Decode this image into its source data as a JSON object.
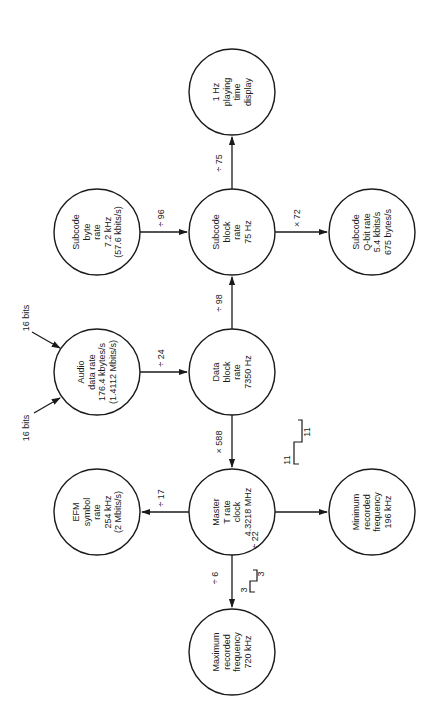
{
  "diagram": {
    "orientation": "rotated-90-ccw",
    "nodes": [
      {
        "id": "playing_time",
        "lines": [
          "1 Hz",
          "playing",
          "time",
          "display"
        ],
        "cx": 232,
        "cy": 92
      },
      {
        "id": "subcode_byte",
        "lines": [
          "Subcode",
          "byte",
          "rate",
          "7.2 kHz",
          "(57.6 kbits/s)"
        ],
        "cx": 97,
        "cy": 232
      },
      {
        "id": "subcode_block",
        "lines": [
          "Subcode",
          "block",
          "rate",
          "75 Hz"
        ],
        "cx": 232,
        "cy": 232
      },
      {
        "id": "subcode_qbit",
        "lines": [
          "Subcode",
          "Q-bit rate",
          "5.4 kbits/s",
          "675 bytes/s"
        ],
        "cx": 372,
        "cy": 232
      },
      {
        "id": "audio_data",
        "lines": [
          "Audio",
          "data rate",
          "176.4 kbytes/s",
          "(1.4112 Mbits/s)"
        ],
        "cx": 97,
        "cy": 372
      },
      {
        "id": "data_block",
        "lines": [
          "Data",
          "block",
          "rate",
          "7350 Hz"
        ],
        "cx": 232,
        "cy": 372
      },
      {
        "id": "efm_symbol",
        "lines": [
          "EFM",
          "symbol",
          "rate",
          "254 kHz",
          "(2 Mbits/s)"
        ],
        "cx": 97,
        "cy": 512
      },
      {
        "id": "master_clock",
        "lines": [
          "Master",
          "T rate",
          "clock",
          "4.3218 MHz"
        ],
        "cx": 232,
        "cy": 512
      },
      {
        "id": "min_freq",
        "lines": [
          "Minimum",
          "recorded",
          "frequency",
          "196 kHz"
        ],
        "cx": 372,
        "cy": 512
      },
      {
        "id": "max_freq",
        "lines": [
          "Maximum",
          "recorded",
          "frequency",
          "720 kHz"
        ],
        "cx": 232,
        "cy": 652
      }
    ],
    "edges": [
      {
        "from": "subcode_block",
        "to": "playing_time",
        "label": "÷ 75"
      },
      {
        "from": "subcode_byte",
        "to": "subcode_block",
        "label": "÷ 96"
      },
      {
        "from": "subcode_block",
        "to": "subcode_qbit",
        "label": "× 72"
      },
      {
        "from": "data_block",
        "to": "subcode_block",
        "label": "÷ 98"
      },
      {
        "from": "audio_data",
        "to": "data_block",
        "label": "÷ 24"
      },
      {
        "from": "data_block",
        "to": "master_clock",
        "label": "× 588"
      },
      {
        "from": "master_clock",
        "to": "efm_symbol",
        "label": "÷ 17"
      },
      {
        "from": "master_clock",
        "to": "min_freq",
        "label": "÷ 22"
      },
      {
        "from": "master_clock",
        "to": "max_freq",
        "label": "÷ 6"
      }
    ],
    "inputs": [
      {
        "label": "16 bits",
        "position": "upper"
      },
      {
        "label": "16 bits",
        "position": "lower"
      }
    ],
    "waveforms": [
      {
        "id": "min_wave",
        "labels": [
          "11",
          "11"
        ]
      },
      {
        "id": "max_wave",
        "labels": [
          "3",
          "3"
        ]
      }
    ]
  }
}
